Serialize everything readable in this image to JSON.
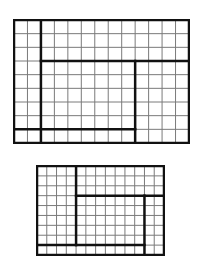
{
  "diagrams": [
    {
      "name": "large-grid",
      "x": 13,
      "y": 19,
      "width": 175,
      "height": 123,
      "cols": 13,
      "rows": 9,
      "thick_lines": {
        "vertical": [
          {
            "col": 2,
            "from_row": 0,
            "to_row": 9
          },
          {
            "col": 9,
            "from_row": 3,
            "to_row": 9
          }
        ],
        "horizontal": [
          {
            "row": 3,
            "from_col": 2,
            "to_col": 13
          },
          {
            "row": 8,
            "from_col": 0,
            "to_col": 9
          }
        ]
      }
    },
    {
      "name": "small-grid",
      "x": 36,
      "y": 165,
      "width": 127,
      "height": 89,
      "cols": 13,
      "rows": 9,
      "thick_lines": {
        "vertical": [
          {
            "col": 4,
            "from_row": 0,
            "to_row": 8
          },
          {
            "col": 11,
            "from_row": 3,
            "to_row": 9
          }
        ],
        "horizontal": [
          {
            "row": 3,
            "from_col": 4,
            "to_col": 13
          },
          {
            "row": 8,
            "from_col": 0,
            "to_col": 11
          }
        ]
      }
    }
  ],
  "colors": {
    "grid_line": "#7a7a7a",
    "thick_line": "#111111",
    "background": "#ffffff"
  }
}
